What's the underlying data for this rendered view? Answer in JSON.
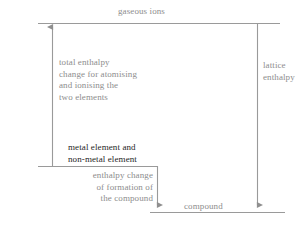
{
  "diagram": {
    "colors": {
      "line": "#9a9a9a",
      "text_grey": "#8d8d8d",
      "text_dark": "#262626",
      "background": "#ffffff"
    },
    "labels": {
      "gaseous_ions": "gaseous ions",
      "total_enthalpy": "total enthalpy\nchange for atomising\nand ionising the\ntwo elements",
      "lattice_enthalpy": "lattice\nenthalpy",
      "metal_element": "metal element and\nnon-metal element",
      "enthalpy_formation": "enthalpy change\nof formation of\nthe compound",
      "compound": "compound"
    },
    "levels": [
      {
        "name": "gaseous-ions-level",
        "y": 23,
        "x1": 38,
        "x2": 280
      },
      {
        "name": "elements-level",
        "y": 166,
        "x1": 38,
        "x2": 157
      },
      {
        "name": "compound-level",
        "y": 212,
        "x1": 150,
        "x2": 285
      }
    ],
    "arrows": [
      {
        "name": "total-enthalpy-arrow",
        "x": 52,
        "y1": 166,
        "y2": 25,
        "direction": "up"
      },
      {
        "name": "lattice-enthalpy-arrow",
        "x": 257,
        "y1": 23,
        "y2": 210,
        "direction": "down"
      },
      {
        "name": "formation-enthalpy-arrow",
        "x": 157,
        "y1": 166,
        "y2": 210,
        "direction": "down"
      }
    ]
  }
}
